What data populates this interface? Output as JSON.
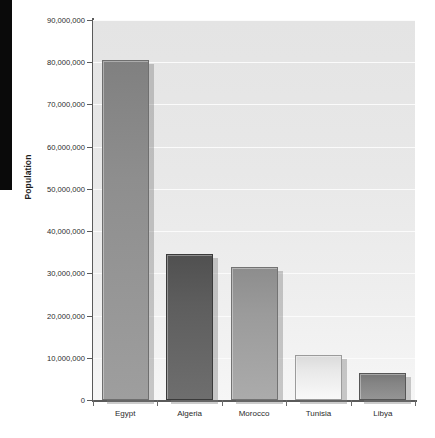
{
  "chart_data": {
    "type": "bar",
    "title": "",
    "xlabel": "",
    "ylabel": "Population",
    "categories": [
      "Egypt",
      "Algeria",
      "Morocco",
      "Tunisia",
      "Libya"
    ],
    "values": [
      80500000,
      34500000,
      31500000,
      10600000,
      6300000
    ],
    "ylim": [
      0,
      90000000
    ],
    "ytick_values": [
      0,
      10000000,
      20000000,
      30000000,
      40000000,
      50000000,
      60000000,
      70000000,
      80000000,
      90000000
    ],
    "ytick_labels": [
      "0",
      "10,000,000",
      "20,000,000",
      "30,000,000",
      "40,000,000",
      "50,000,000",
      "60,000,000",
      "70,000,000",
      "80,000,000",
      "90,000,000"
    ],
    "grid": true,
    "legend": false,
    "legend_position": "none",
    "bar_colors": [
      "#8e8e8e",
      "#5e5e5e",
      "#9b9b9b",
      "#e9e9e9",
      "#848484"
    ],
    "bar_border_colors": [
      "#6f6f6f",
      "#3a3a3a",
      "#737373",
      "#9b9b9b",
      "#565656"
    ],
    "plot_background": "#e9e9e9",
    "gridline_color": "#fbfbfb",
    "axis_color": "#5a5a5a",
    "text_color": "#2b2b2b",
    "page_background": "#ffffff",
    "marker_block_color": "#0a0a0a"
  }
}
